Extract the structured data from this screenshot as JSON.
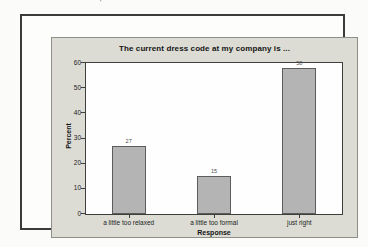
{
  "artifact_mark": "'",
  "chart_data": {
    "type": "bar",
    "title": "The current dress code at my company is ...",
    "categories": [
      "a little too relaxed",
      "a little too formal",
      "just right"
    ],
    "values": [
      27,
      15,
      58
    ],
    "bar_labels": [
      "27",
      "15",
      "58"
    ],
    "xlabel": "Response",
    "ylabel": "Percent",
    "ylim": [
      0,
      60
    ],
    "yticks": [
      0,
      10,
      20,
      30,
      40,
      50,
      60
    ],
    "grid": false,
    "legend": false,
    "bar_color": "#b4b4b4",
    "bar_border_color": "#5c5c5c",
    "panel_bg": "#dcdcd4",
    "plot_bg": "#fefefe"
  }
}
